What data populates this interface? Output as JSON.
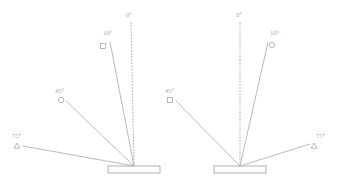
{
  "figure": {
    "title": "",
    "background": "#ffffff",
    "line_color": "#a3a3a3",
    "label_color": "#a8a8a8",
    "plate_fill": "#ffffff",
    "plate_stroke": "#9e9e9e"
  },
  "panels": [
    {
      "id": "left-panel",
      "name": "left-diagram",
      "origin": {
        "x": 134,
        "y": 166
      },
      "plate": {
        "x": 108,
        "y": 166,
        "width": 52,
        "height": 7
      },
      "rays": [
        {
          "angle_label": "0°",
          "angle_value": 0,
          "style": "dotted",
          "marker": "none",
          "side": "right",
          "end": {
            "x": 131,
            "y": 22
          },
          "label_pos": {
            "x": 126,
            "y": 12
          }
        },
        {
          "angle_label": "10°",
          "angle_value": 10,
          "style": "solid",
          "marker": "square",
          "side": "right",
          "end": {
            "x": 110,
            "y": 42
          },
          "marker_pos": {
            "x": 103,
            "y": 46
          },
          "label_pos": {
            "x": 103,
            "y": 30
          }
        },
        {
          "angle_label": "45°",
          "angle_value": 45,
          "style": "solid",
          "marker": "circle",
          "side": "left",
          "end": {
            "x": 66,
            "y": 101
          },
          "marker_pos": {
            "x": 61,
            "y": 100
          },
          "label_pos": {
            "x": 55,
            "y": 88
          }
        },
        {
          "angle_label": "75°",
          "angle_value": 75,
          "style": "solid",
          "marker": "triangle",
          "side": "left",
          "end": {
            "x": 23,
            "y": 146
          },
          "marker_pos": {
            "x": 17,
            "y": 146
          },
          "label_pos": {
            "x": 12,
            "y": 133
          }
        }
      ]
    },
    {
      "id": "right-panel",
      "name": "right-diagram",
      "origin": {
        "x": 240,
        "y": 166
      },
      "plate": {
        "x": 214,
        "y": 166,
        "width": 52,
        "height": 7
      },
      "rays": [
        {
          "angle_label": "0°",
          "angle_value": 0,
          "style": "dotted",
          "marker": "none",
          "side": "left",
          "end": {
            "x": 240,
            "y": 22
          },
          "label_pos": {
            "x": 236,
            "y": 12
          }
        },
        {
          "angle_label": "10°",
          "angle_value": 10,
          "style": "solid",
          "marker": "circle",
          "side": "right",
          "end": {
            "x": 268,
            "y": 42
          },
          "marker_pos": {
            "x": 272,
            "y": 45
          },
          "label_pos": {
            "x": 270,
            "y": 30
          }
        },
        {
          "angle_label": "45°",
          "angle_value": 45,
          "style": "solid",
          "marker": "square",
          "side": "left",
          "end": {
            "x": 176,
            "y": 101
          },
          "marker_pos": {
            "x": 170,
            "y": 100
          },
          "label_pos": {
            "x": 165,
            "y": 88
          }
        },
        {
          "angle_label": "75°",
          "angle_value": 75,
          "style": "solid",
          "marker": "triangle",
          "side": "right",
          "end": {
            "x": 310,
            "y": 144
          },
          "marker_pos": {
            "x": 314,
            "y": 146
          },
          "label_pos": {
            "x": 316,
            "y": 133
          }
        }
      ]
    }
  ]
}
